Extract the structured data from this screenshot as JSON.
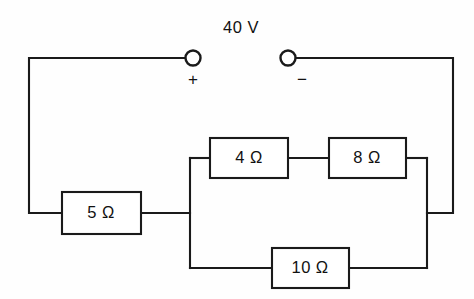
{
  "diagram": {
    "background_color": "#fefefe",
    "line_color": "#1a1a1a",
    "source": {
      "label": "40 V",
      "positive_terminal_label": "+",
      "negative_terminal_label": "−",
      "terminal_icon": "open-circle-terminal"
    },
    "resistors": [
      {
        "id": "r5",
        "label": "5 Ω",
        "value": 5,
        "unit": "Ω",
        "branch": "series"
      },
      {
        "id": "r4",
        "label": "4 Ω",
        "value": 4,
        "unit": "Ω",
        "branch": "upper-parallel"
      },
      {
        "id": "r8",
        "label": "8 Ω",
        "value": 8,
        "unit": "Ω",
        "branch": "upper-parallel"
      },
      {
        "id": "r10",
        "label": "10 Ω",
        "value": 10,
        "unit": "Ω",
        "branch": "lower-parallel"
      }
    ]
  }
}
